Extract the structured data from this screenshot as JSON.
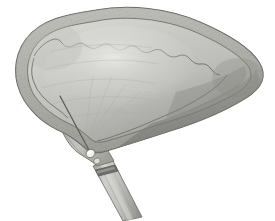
{
  "document": {
    "type": "anatomical-illustration",
    "title": "Gallbladder with transhepatic needle and cystic duct catheter",
    "subject": "gallbladder",
    "style": "grayscale pen-and-wash medical illustration",
    "background_color": "#ffffff",
    "width": 275,
    "height": 221
  },
  "palette": {
    "background": "#ffffff",
    "body_fill_light": "#cfcfcd",
    "body_fill_mid": "#bcbcb9",
    "body_fill_dark": "#9a9a97",
    "body_shadow": "#7d7d7a",
    "highlight": "#e2e2df",
    "rim_band": "#b3b3ae",
    "rim_band_dark": "#8d8d88",
    "outline": "#5e5e5b",
    "outline_soft": "#7a7a76",
    "needle": "#4a4a48",
    "duct_fill": "#c2c2be",
    "duct_shadow": "#94948f",
    "duct_band": "#6e6e6a",
    "hub_highlight": "#f2f2f0"
  },
  "structures": [
    {
      "id": "gallbladder-body",
      "label": "Gallbladder body (fundus and corpus)",
      "description": "Large distended pear-shaped sac occupying the upper two thirds of the frame, widest at the left and tapering to a rounded point at the right",
      "interactable": false
    },
    {
      "id": "serosal-rim",
      "label": "Serosal rim",
      "description": "Scalloped textured band following the outer contour of the sac",
      "interactable": false
    },
    {
      "id": "inner-scallop-line",
      "label": "Inner scalloped border",
      "description": "Wavy line separating the serosal rim from the smooth inner wall",
      "interactable": false
    },
    {
      "id": "wall-highlight",
      "label": "Specular highlight",
      "description": "Pale sheen across the upper mid portion of the sac",
      "interactable": false
    },
    {
      "id": "inferior-shadow",
      "label": "Inferior shadow band",
      "description": "Darker tonal band along the lower right margin of the sac",
      "interactable": false
    },
    {
      "id": "needle",
      "label": "Puncture needle / guidewire",
      "description": "Thin dark straight line entering the wall at the upper left and descending to the neck",
      "interactable": false
    },
    {
      "id": "needle-hub",
      "label": "Needle entry hub",
      "description": "Small bright collar where the needle meets the gallbladder neck",
      "interactable": false
    },
    {
      "id": "neck",
      "label": "Gallbladder neck (infundibulum)",
      "description": "Narrowed segment at the lower center joining the sac to the duct",
      "interactable": false
    },
    {
      "id": "cystic-duct",
      "label": "Cystic duct with catheter",
      "description": "Cylindrical tube descending to the lower right with a dark ligature band near its upper end",
      "interactable": false
    },
    {
      "id": "duct-band",
      "label": "Ligature / marker band",
      "description": "Dark transverse ring across the duct just below the neck",
      "interactable": false
    }
  ]
}
